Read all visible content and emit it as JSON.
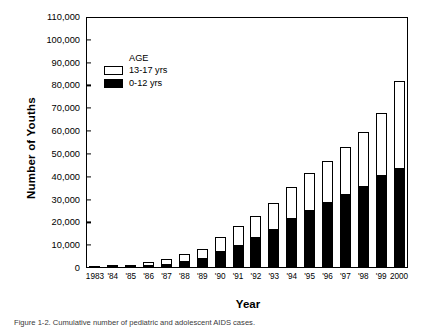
{
  "chart_data": {
    "type": "bar",
    "subtype": "stacked-bar",
    "title": "",
    "xlabel": "Year",
    "ylabel": "Number of Youths",
    "ylim": [
      0,
      110000
    ],
    "ytick_step": 10000,
    "yticks": [
      0,
      10000,
      20000,
      30000,
      40000,
      50000,
      60000,
      70000,
      80000,
      90000,
      100000,
      110000
    ],
    "ytick_labels": [
      "0",
      "10,000",
      "20,000",
      "30,000",
      "40,000",
      "50,000",
      "60,000",
      "70,000",
      "80,000",
      "90,000",
      "100,000",
      "110,000"
    ],
    "grid": false,
    "legend_position": "upper-left-inside",
    "legend_title": "AGE",
    "categories": [
      "1983",
      "'84",
      "'85",
      "'86",
      "'87",
      "'88",
      "'89",
      "'90",
      "'91",
      "'92",
      "'93",
      "'94",
      "'95",
      "'96",
      "'97",
      "'98",
      "'99",
      "2000"
    ],
    "x": [
      1983,
      1984,
      1985,
      1986,
      1987,
      1988,
      1989,
      1990,
      1991,
      1992,
      1993,
      1994,
      1995,
      1996,
      1997,
      1998,
      1999,
      2000
    ],
    "series": [
      {
        "name": "0-12 yrs",
        "color": "#000000",
        "values": [
          200,
          400,
          600,
          900,
          1300,
          2600,
          4000,
          7000,
          9500,
          13000,
          16500,
          21500,
          25000,
          28500,
          32000,
          35500,
          40500,
          43500
        ]
      },
      {
        "name": "13-17 yrs",
        "color": "#ffffff",
        "values": [
          100,
          200,
          700,
          1600,
          2600,
          3400,
          4500,
          6500,
          9000,
          10000,
          12000,
          14000,
          16500,
          18500,
          21000,
          24000,
          27500,
          38500
        ]
      }
    ],
    "totals": [
      300,
      600,
      1300,
      2500,
      3900,
      6000,
      8500,
      13500,
      18500,
      23000,
      28500,
      35500,
      41500,
      47000,
      53000,
      59500,
      68000,
      82000
    ]
  },
  "axes": {
    "y_title": "Number of Youths",
    "x_title": "Year"
  },
  "legend": {
    "title": "AGE",
    "entries": [
      {
        "label": "13-17 yrs",
        "swatch": "open-square"
      },
      {
        "label": "0-12 yrs",
        "swatch": "filled-square"
      }
    ]
  },
  "caption": {
    "text": "Figure 1-2.  Cumulative number of pediatric and adolescent AIDS cases."
  }
}
